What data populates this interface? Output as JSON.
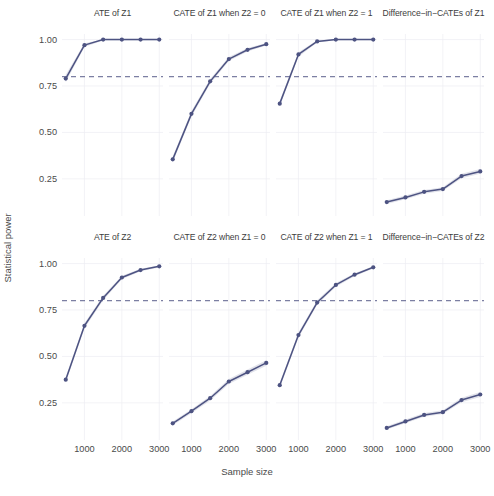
{
  "axes": {
    "ylabel": "Statistical power",
    "xlabel": "Sample size",
    "yticks": [
      "0.25",
      "0.50",
      "0.75",
      "1.00"
    ],
    "xticks": [
      "1000",
      "2000",
      "3000"
    ]
  },
  "style": {
    "line_color": "#4d5382",
    "ref_color": "#5b5f8c",
    "grid_color": "#ececf2",
    "band_color": "#4d5382"
  },
  "chart_data": {
    "type": "line",
    "title": "",
    "xlabel": "Sample size",
    "ylabel": "Statistical power",
    "xlim": [
      400,
      3100
    ],
    "ylim": [
      0.05,
      1.03
    ],
    "yticks": [
      0.25,
      0.5,
      0.75,
      1.0
    ],
    "xticks": [
      1000,
      2000,
      3000
    ],
    "grid": true,
    "legend": "none",
    "reference_line": {
      "y": 0.8,
      "style": "dashed",
      "label": "0.80 power"
    },
    "x": [
      500,
      1000,
      1500,
      2000,
      2500,
      3000
    ],
    "panels": [
      {
        "title": "ATE of Z1",
        "row": 0,
        "col": 0,
        "values": [
          0.79,
          0.97,
          1.0,
          1.0,
          1.0,
          1.0
        ],
        "ci_low": [
          0.77,
          0.96,
          0.995,
          0.995,
          0.995,
          0.995
        ],
        "ci_high": [
          0.81,
          0.98,
          1.0,
          1.0,
          1.0,
          1.0
        ]
      },
      {
        "title": "CATE of Z1 when Z2 = 0",
        "row": 0,
        "col": 1,
        "values": [
          0.355,
          0.6,
          0.775,
          0.895,
          0.945,
          0.975
        ],
        "ci_low": [
          0.34,
          0.585,
          0.762,
          0.884,
          0.936,
          0.968
        ],
        "ci_high": [
          0.37,
          0.615,
          0.788,
          0.906,
          0.954,
          0.982
        ]
      },
      {
        "title": "CATE of Z1 when Z2 = 1",
        "row": 0,
        "col": 2,
        "values": [
          0.655,
          0.92,
          0.99,
          1.0,
          1.0,
          1.0
        ],
        "ci_low": [
          0.64,
          0.908,
          0.984,
          0.996,
          0.996,
          0.996
        ],
        "ci_high": [
          0.67,
          0.932,
          0.996,
          1.0,
          1.0,
          1.0
        ]
      },
      {
        "title": "Difference−in−CATEs of Z1",
        "row": 0,
        "col": 3,
        "values": [
          0.125,
          0.15,
          0.18,
          0.195,
          0.265,
          0.29
        ],
        "ci_low": [
          0.115,
          0.14,
          0.17,
          0.185,
          0.253,
          0.277
        ],
        "ci_high": [
          0.135,
          0.16,
          0.19,
          0.205,
          0.277,
          0.303
        ]
      },
      {
        "title": "ATE of Z2",
        "row": 1,
        "col": 0,
        "values": [
          0.375,
          0.665,
          0.815,
          0.925,
          0.965,
          0.985
        ],
        "ci_low": [
          0.36,
          0.651,
          0.803,
          0.916,
          0.958,
          0.979
        ],
        "ci_high": [
          0.39,
          0.679,
          0.827,
          0.934,
          0.972,
          0.991
        ]
      },
      {
        "title": "CATE of Z2 when Z1 = 0",
        "row": 1,
        "col": 1,
        "values": [
          0.14,
          0.205,
          0.275,
          0.365,
          0.415,
          0.465
        ],
        "ci_low": [
          0.13,
          0.194,
          0.263,
          0.352,
          0.401,
          0.45
        ],
        "ci_high": [
          0.15,
          0.216,
          0.287,
          0.378,
          0.429,
          0.48
        ]
      },
      {
        "title": "CATE of Z2 when Z1 = 1",
        "row": 1,
        "col": 2,
        "values": [
          0.345,
          0.615,
          0.79,
          0.885,
          0.94,
          0.98
        ],
        "ci_low": [
          0.33,
          0.601,
          0.778,
          0.875,
          0.932,
          0.974
        ],
        "ci_high": [
          0.36,
          0.629,
          0.802,
          0.895,
          0.948,
          0.986
        ]
      },
      {
        "title": "Difference−in−CATEs of Z2",
        "row": 1,
        "col": 3,
        "values": [
          0.115,
          0.15,
          0.185,
          0.2,
          0.265,
          0.295
        ],
        "ci_low": [
          0.106,
          0.14,
          0.175,
          0.19,
          0.253,
          0.282
        ],
        "ci_high": [
          0.124,
          0.16,
          0.195,
          0.21,
          0.277,
          0.308
        ]
      }
    ]
  }
}
